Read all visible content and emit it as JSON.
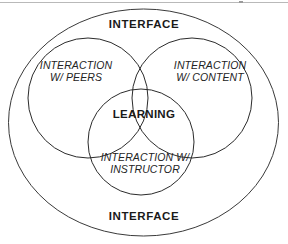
{
  "diagram": {
    "title_top": "INTERFACE",
    "title_bottom": "INTERFACE",
    "center_label": "LEARNING",
    "circles": [
      {
        "id": "peers",
        "label": "INTERACTION\nW/ PEERS"
      },
      {
        "id": "content",
        "label": "INTERACTION\nW/ CONTENT"
      },
      {
        "id": "instructor",
        "label": "INTERACTION W/\nINSTRUCTOR"
      }
    ],
    "colors": {
      "stroke": "#2b2b2b",
      "outer_stroke": "#3a3a3a",
      "text": "#1a1a1a",
      "background": "#ffffff",
      "top_rule": "#b9b9b9"
    }
  }
}
